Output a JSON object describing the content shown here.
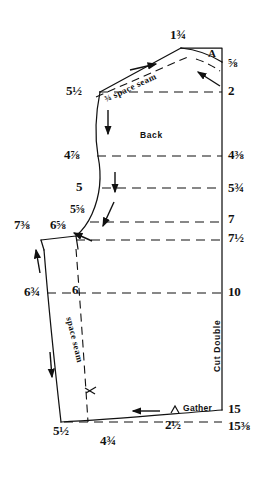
{
  "diagram": {
    "title_piece": "Back",
    "cut_instruction": "Cut Double",
    "point_labels": {
      "shoulder_point": "A"
    },
    "seam_notes": {
      "shoulder_seam": "¾ space seam",
      "side_seam": "space seam",
      "gather": "Gather"
    },
    "measurements": {
      "top_center": "1¾",
      "right_column": [
        {
          "name": "neck-depth",
          "value": "⅝"
        },
        {
          "name": "shoulder-line",
          "value": "2"
        },
        {
          "name": "underarm-line",
          "value": "4⅜"
        },
        {
          "name": "chest-line",
          "value": "5¾"
        },
        {
          "name": "bust-line",
          "value": "7"
        },
        {
          "name": "waist-line",
          "value": "7½"
        },
        {
          "name": "hip-line",
          "value": "10"
        },
        {
          "name": "hem-line",
          "value": "15"
        },
        {
          "name": "hem-corner",
          "value": "15⅜"
        }
      ],
      "left_column": [
        {
          "name": "shoulder-tip",
          "value": "5½"
        },
        {
          "name": "armhole-upper",
          "value": "4⅞"
        },
        {
          "name": "armhole-mid",
          "value": "5"
        },
        {
          "name": "armhole-lower",
          "value": "5⅝"
        },
        {
          "name": "underarm-outer",
          "value": "7⅜"
        },
        {
          "name": "underarm-inner",
          "value": "6⅝"
        },
        {
          "name": "hip-left-outer",
          "value": "6¾"
        },
        {
          "name": "hip-left-inner",
          "value": "6"
        },
        {
          "name": "hem-left",
          "value": "5½"
        }
      ],
      "bottom": [
        {
          "name": "hem-segment-left",
          "value": "4¾"
        },
        {
          "name": "hem-gather-segment",
          "value": "2½"
        }
      ]
    }
  }
}
